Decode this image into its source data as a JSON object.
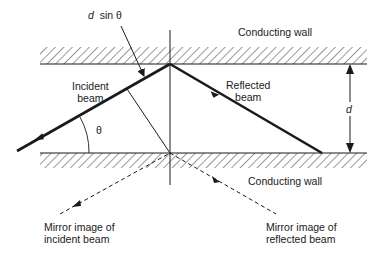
{
  "diagram": {
    "type": "waveguide-reflection",
    "labels": {
      "top_wall": "Conducting wall",
      "bottom_wall": "Conducting wall",
      "incident_line1": "Incident",
      "incident_line2": "beam",
      "reflected_line1": "Reflected",
      "reflected_line2": "beam",
      "d_sin_theta_d": "d",
      "d_sin_theta_rest": "sin θ",
      "separation": "d",
      "theta": "θ",
      "mirror_incident_line1": "Mirror image of",
      "mirror_incident_line2": "incident beam",
      "mirror_reflected_line1": "Mirror image of",
      "mirror_reflected_line2": "reflected beam"
    },
    "colors": {
      "ink": "#1a1a1a",
      "background": "#ffffff"
    }
  }
}
